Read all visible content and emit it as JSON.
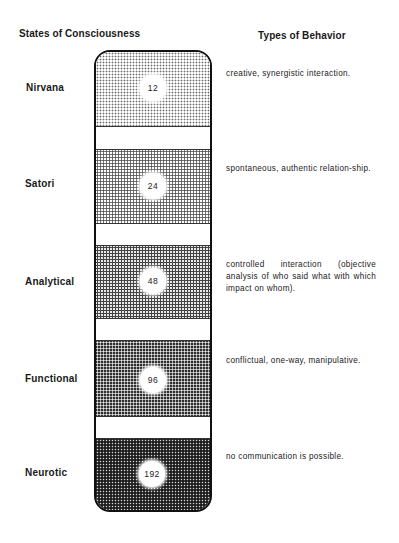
{
  "headers": {
    "left": "States of Consciousness",
    "right": "Types of Behavior"
  },
  "states": [
    {
      "name": "Nirvana",
      "value": "12",
      "behavior": "creative, synergistic interaction."
    },
    {
      "name": "Satori",
      "value": "24",
      "behavior": "spontaneous, authentic relation-ship."
    },
    {
      "name": "Analytical",
      "value": "48",
      "behavior": "controlled interaction (objective analysis of who said what with which impact on whom)."
    },
    {
      "name": "Functional",
      "value": "96",
      "behavior": "conflictual, one-way, manipulative."
    },
    {
      "name": "Neurotic",
      "value": "192",
      "behavior": "no communication is possible."
    }
  ],
  "colors": {
    "outline": "#111111",
    "background": "#ffffff",
    "text": "#1a1a1a"
  }
}
